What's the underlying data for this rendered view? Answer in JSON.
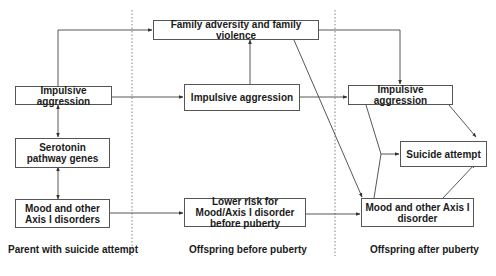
{
  "diagram": {
    "nodes": {
      "family_adversity": "Family adversity and family violence",
      "parent_impulsive": "Impulsive aggression",
      "serotonin": "Serotonin pathway genes",
      "parent_mood": "Mood and other Axis I disorders",
      "offspring_pre_impulsive": "Impulsive aggression",
      "offspring_pre_lower_risk": "Lower risk for Mood/Axis I disorder before puberty",
      "offspring_post_impulsive": "Impulsive aggression",
      "suicide_attempt": "Suicide attempt",
      "offspring_post_mood": "Mood and other Axis I disorder"
    },
    "phases": {
      "parent": "Parent with suicide attempt",
      "before": "Offspring before puberty",
      "after": "Offspring after puberty"
    },
    "edges": [
      {
        "from": "parent_impulsive",
        "to": "family_adversity"
      },
      {
        "from": "parent_impulsive",
        "to": "offspring_pre_impulsive"
      },
      {
        "from": "parent_impulsive",
        "to": "serotonin",
        "bidirectional": true
      },
      {
        "from": "serotonin",
        "to": "parent_mood",
        "bidirectional": true
      },
      {
        "from": "parent_mood",
        "to": "offspring_pre_lower_risk"
      },
      {
        "from": "offspring_pre_impulsive",
        "to": "family_adversity"
      },
      {
        "from": "offspring_pre_impulsive",
        "to": "offspring_post_impulsive"
      },
      {
        "from": "family_adversity",
        "to": "offspring_post_impulsive"
      },
      {
        "from": "family_adversity",
        "to": "offspring_post_mood"
      },
      {
        "from": "offspring_pre_lower_risk",
        "to": "offspring_post_mood"
      },
      {
        "from": "offspring_post_impulsive",
        "to": "suicide_attempt"
      },
      {
        "from": "offspring_post_impulsive",
        "to": "suicide_attempt",
        "via": "junction"
      },
      {
        "from": "offspring_post_mood",
        "to": "suicide_attempt",
        "via": "junction"
      },
      {
        "from": "offspring_post_mood",
        "to": "suicide_attempt"
      }
    ],
    "colors": {
      "line": "#444444",
      "box_border": "#555555",
      "divider": "#666666"
    }
  }
}
